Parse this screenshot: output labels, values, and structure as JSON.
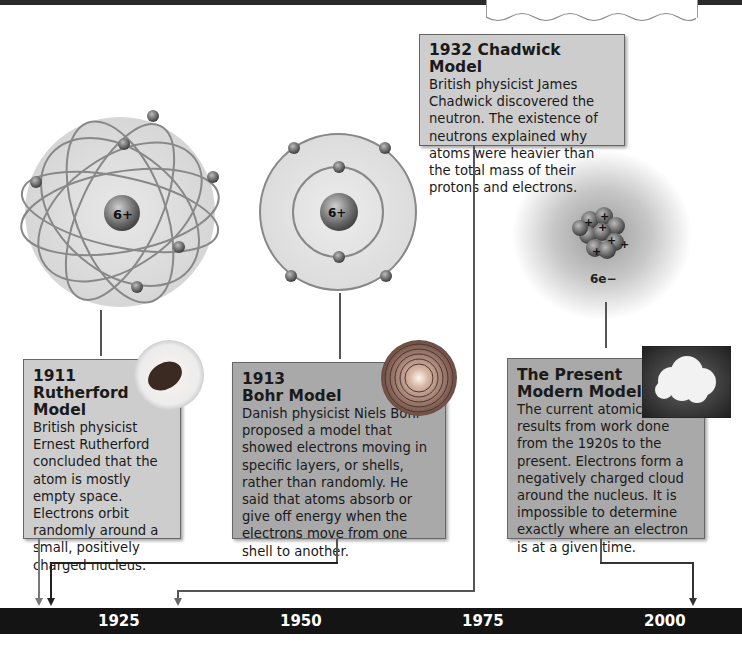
{
  "header": {
    "decorative_tab": true
  },
  "models": [
    {
      "id": "chadwick",
      "title": "1932 Chadwick Model",
      "body": "British physicist James Chadwick discovered the neutron. The existence of neutrons explained why atoms were heavier than the total mass of their protons and electrons."
    },
    {
      "id": "rutherford",
      "title_line1": "1911",
      "title_line2": "Rutherford",
      "title_line3": "Model",
      "body": "British physicist Ernest Rutherford concluded that the atom is mostly empty space. Electrons orbit randomly around a small, positively charged nucleus.",
      "photo": "peach-pit"
    },
    {
      "id": "bohr",
      "title_line1": "1913",
      "title_line2": "Bohr Model",
      "body": "Danish physicist Niels Bohr proposed a model that showed electrons moving in specific layers, or shells, rather than randomly. He said that atoms absorb or give off energy when the electrons move from one shell to another.",
      "photo": "onion-slice"
    },
    {
      "id": "modern",
      "title_line1": "The Present",
      "title_line2": "Modern Model",
      "body": "The current atomic model results from work done from the 1920s to the present. Electrons form a negatively charged cloud around the nucleus. It is impossible to determine exactly where an electron is at a given time.",
      "photo": "cloud"
    }
  ],
  "diagrams": {
    "rutherford": {
      "nucleus_label": "6+",
      "electron_label": "e−",
      "electron_count": 6
    },
    "bohr": {
      "nucleus_label": "6+",
      "electron_label": "e−",
      "electron_count": 6
    },
    "modern": {
      "cloud_label": "6e−"
    }
  },
  "timeline": {
    "labels": [
      "1925",
      "1950",
      "1975",
      "2000"
    ],
    "bar_color": "#141414"
  }
}
